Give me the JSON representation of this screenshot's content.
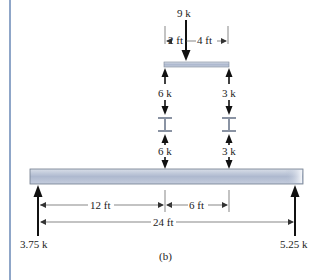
{
  "figure": {
    "caption": "(b)",
    "accent_color": "#8fa6c8",
    "beam_color": "#b9c3d6",
    "top_load": {
      "label": "9 k",
      "dim_left": "2 ft",
      "dim_right": "4 ft"
    },
    "connectors": {
      "left_upper": "6 k",
      "left_lower": "6 k",
      "right_upper": "3 k",
      "right_lower": "3 k"
    },
    "main_beam": {
      "dim_a": "12 ft",
      "dim_b": "6 ft",
      "dim_total": "24 ft"
    },
    "reactions": {
      "left": "3.75 k",
      "right": "5.25 k"
    }
  }
}
